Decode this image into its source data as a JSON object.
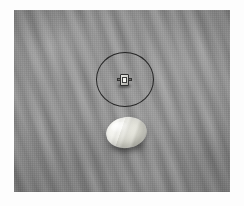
{
  "image": {
    "title": "Seafloor survey still frame",
    "medium": "grayscale photograph",
    "width_px": 244,
    "height_px": 206,
    "border": {
      "color": "#fdfdfd",
      "left_px": 14,
      "top_px": 10,
      "right_px": 14,
      "bottom_px": 14
    },
    "plate": {
      "color_base": "#8a8a8a",
      "color_light": "#959595",
      "color_dark": "#787878",
      "width_px": 216,
      "height_px": 182
    }
  },
  "scene": {
    "background_label": "rippled sand seabed",
    "ripple_direction": "diagonal, lower-left to upper-right",
    "lighting": "diffuse overhead"
  },
  "annotations": [
    {
      "name": "detection-circle",
      "shape": "circle",
      "stroke_color": "#1b1b1b",
      "stroke_width_px": 1.6,
      "center_x_px": 111,
      "center_y_px": 69,
      "width_px": 58,
      "height_px": 55,
      "label": ""
    }
  ],
  "objects": [
    {
      "name": "target-object",
      "description": "small bright cube-like object with lateral protrusions",
      "center_x_px": 110,
      "center_y_px": 70,
      "width_px": 15,
      "height_px": 15,
      "color_light": "#f2f2ee",
      "color_mid": "#cfcfca",
      "color_dark": "#2e2e2e"
    },
    {
      "name": "ellipse-object",
      "description": "large pale rounded ellipsoidal object resting on sediment",
      "center_x_px": 112,
      "center_y_px": 122,
      "width_px": 41,
      "height_px": 31,
      "rotation_deg": -9,
      "color_light": "#fbfbf7",
      "color_mid": "#ececE4",
      "color_dark": "#bdbdb3"
    }
  ]
}
